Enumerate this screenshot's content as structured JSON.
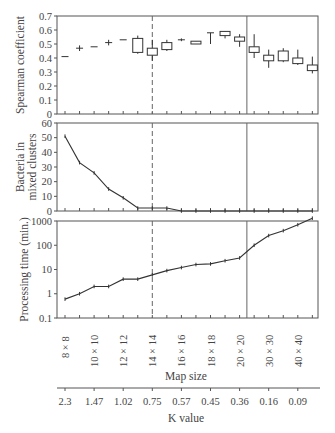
{
  "chart_data": [
    {
      "type": "box",
      "panel": "top",
      "ylabel": "Spearman coefficient",
      "ylim": [
        0,
        0.7
      ],
      "yticks": [
        "0",
        "0.1",
        "0.2",
        "0.3",
        "0.4",
        "0.5",
        "0.6",
        "0.7"
      ],
      "boxes": [
        {
          "q1": 0.41,
          "q3": 0.41,
          "min": 0.41,
          "max": 0.41
        },
        {
          "q1": 0.47,
          "q3": 0.47,
          "min": 0.45,
          "max": 0.49
        },
        {
          "q1": 0.48,
          "q3": 0.48,
          "min": 0.48,
          "max": 0.48
        },
        {
          "q1": 0.51,
          "q3": 0.51,
          "min": 0.49,
          "max": 0.53
        },
        {
          "q1": 0.53,
          "q3": 0.53,
          "min": 0.53,
          "max": 0.53
        },
        {
          "q1": 0.44,
          "q3": 0.54,
          "min": 0.43,
          "max": 0.56
        },
        {
          "q1": 0.42,
          "q3": 0.47,
          "min": 0.38,
          "max": 0.53
        },
        {
          "q1": 0.46,
          "q3": 0.51,
          "min": 0.45,
          "max": 0.53
        },
        {
          "q1": 0.53,
          "q3": 0.53,
          "min": 0.52,
          "max": 0.54
        },
        {
          "q1": 0.5,
          "q3": 0.52,
          "min": 0.5,
          "max": 0.52
        },
        {
          "q1": 0.58,
          "q3": 0.58,
          "min": 0.5,
          "max": 0.58
        },
        {
          "q1": 0.56,
          "q3": 0.59,
          "min": 0.54,
          "max": 0.59
        },
        {
          "q1": 0.52,
          "q3": 0.55,
          "min": 0.48,
          "max": 0.57
        },
        {
          "q1": 0.44,
          "q3": 0.48,
          "min": 0.4,
          "max": 0.57
        },
        {
          "q1": 0.38,
          "q3": 0.42,
          "min": 0.33,
          "max": 0.46
        },
        {
          "q1": 0.38,
          "q3": 0.45,
          "min": 0.37,
          "max": 0.47
        },
        {
          "q1": 0.36,
          "q3": 0.4,
          "min": 0.35,
          "max": 0.46
        },
        {
          "q1": 0.31,
          "q3": 0.35,
          "min": 0.29,
          "max": 0.41
        }
      ]
    },
    {
      "type": "line",
      "panel": "middle",
      "ylabel": "Bacteria in mixed clusters",
      "ylim": [
        0,
        60
      ],
      "yticks": [
        "0",
        "10",
        "20",
        "30",
        "40",
        "50",
        "60"
      ],
      "values": [
        51,
        33,
        26,
        15,
        9,
        2,
        2,
        2,
        0,
        0,
        0,
        0,
        0,
        0,
        0,
        0,
        0,
        0
      ]
    },
    {
      "type": "line",
      "panel": "bottom",
      "ylabel": "Processing time (min.)",
      "yscale": "log",
      "ylim": [
        0.1,
        1000
      ],
      "yticks": [
        "0.1",
        "1",
        "10",
        "100",
        "1000"
      ],
      "values": [
        0.6,
        1,
        2,
        2,
        4,
        4,
        6,
        9,
        12,
        16,
        17,
        23,
        30,
        100,
        250,
        400,
        700,
        1300
      ]
    }
  ],
  "x_axis": {
    "n_points": 18,
    "map_size_label": "Map size",
    "map_size_ticks": [
      "8 × 8",
      "10 × 10",
      "12 × 12",
      "14 × 14",
      "16 × 16",
      "18 × 18",
      "20 × 20",
      "30 × 30",
      "40 × 40"
    ],
    "k_value_label": "K value",
    "k_value_ticks": [
      "2.3",
      "1.47",
      "1.02",
      "0.75",
      "0.57",
      "0.45",
      "0.36",
      "0.16",
      "0.09"
    ]
  },
  "reference_lines": {
    "dashed_index": 6,
    "solid_index": 12.5
  },
  "colors": {
    "line": "#333333",
    "axis": "#555555",
    "box_fill": "#ffffff"
  }
}
